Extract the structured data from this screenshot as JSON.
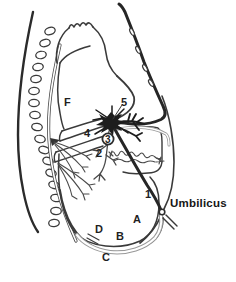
{
  "figure": {
    "colors": {
      "ink": "#333333",
      "thick_vessel": "#262626",
      "gray_vessel": "#9a9a9a",
      "background": "#ffffff"
    },
    "labels": {
      "f": "F",
      "n5": "5",
      "n4": "4",
      "n3": "3",
      "n2": "2",
      "n1": "1",
      "a": "A",
      "b": "B",
      "c": "C",
      "d": "D",
      "umbilicus": "Umbilicus"
    }
  }
}
